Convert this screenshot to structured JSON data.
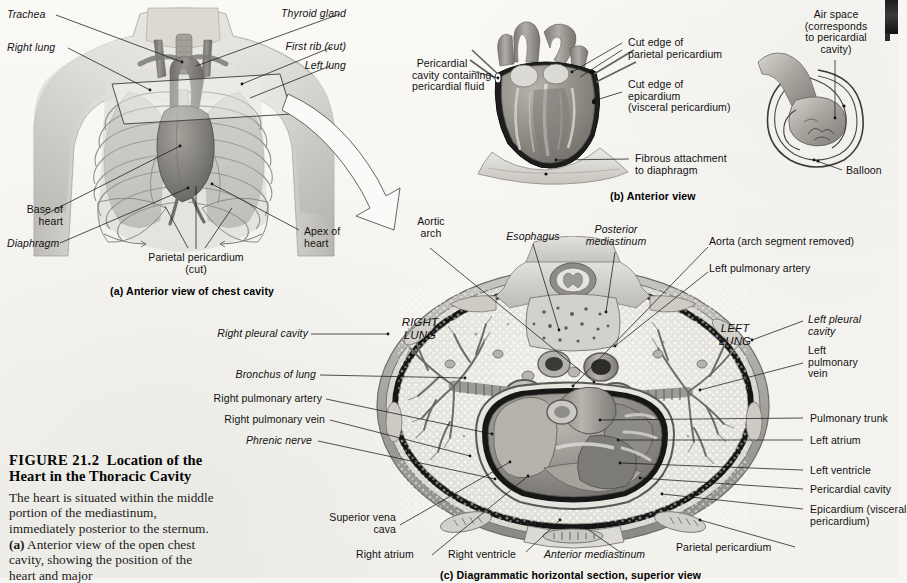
{
  "figure": {
    "number": "FIGURE 21.2",
    "title": "Location of the Heart in the Thoracic Cavity",
    "caption_parts": {
      "p1": "The heart is situated within the middle portion of the mediastinum, immediately posterior to the sternum. ",
      "a_bold": "(a)",
      "p2": " Anterior view of the open chest cavity, showing the position of the heart and major"
    }
  },
  "panel_a": {
    "caption": "(a) Anterior view of chest cavity",
    "labels": {
      "trachea": "Trachea",
      "right_lung": "Right lung",
      "thyroid_gland": "Thyroid gland",
      "first_rib": "First rib (cut)",
      "left_lung": "Left lung",
      "base_of_heart": "Base of\nheart",
      "diaphragm": "Diaphragm",
      "parietal_pericardium": "Parietal pericardium\n(cut)",
      "apex_of_heart": "Apex of\nheart"
    }
  },
  "panel_b": {
    "caption": "(b) Anterior view",
    "labels": {
      "pericardial_cavity": "Pericardial\ncavity containing\npericardial fluid",
      "cut_edge_parietal": "Cut edge of\nparietal pericardium",
      "cut_edge_epicardium": "Cut edge of\nepicardium\n(visceral pericardium)",
      "fibrous_attachment": "Fibrous attachment\nto diaphragm",
      "air_space": "Air space\n(corresponds\nto pericardial\ncavity)",
      "balloon": "Balloon"
    }
  },
  "panel_c": {
    "caption": "(c) Diagrammatic horizontal section, superior view",
    "organ_text": {
      "right_lung": "RIGHT\nLUNG",
      "left_lung": "LEFT\nLUNG"
    },
    "labels_top": {
      "aortic_arch": "Aortic\narch",
      "esophagus": "Esophagus",
      "posterior_mediastinum": "Posterior\nmediastinum",
      "aorta": "Aorta (arch segment removed)",
      "left_pulmonary_artery": "Left pulmonary artery"
    },
    "labels_left": {
      "right_pleural_cavity": "Right pleural cavity",
      "bronchus_of_lung": "Bronchus of lung",
      "right_pulmonary_artery": "Right pulmonary artery",
      "right_pulmonary_vein": "Right pulmonary vein",
      "phrenic_nerve": "Phrenic nerve",
      "superior_vena_cava": "Superior vena\ncava",
      "right_atrium": "Right atrium"
    },
    "labels_right": {
      "left_pleural_cavity": "Left pleural\ncavity",
      "left_pulmonary_vein": "Left\npulmonary\nvein",
      "pulmonary_trunk": "Pulmonary trunk",
      "left_atrium": "Left atrium",
      "left_ventricle": "Left ventricle",
      "pericardial_cavity": "Pericardial cavity",
      "epicardium": "Epicardium (visceral\npericardium)",
      "parietal_pericardium": "Parietal pericardium"
    },
    "labels_bottom": {
      "right_ventricle": "Right ventricle",
      "anterior_mediastinum": "Anterior mediastinum"
    }
  },
  "colors": {
    "page_bg": "#f7f6f3",
    "ink": "#131313",
    "tissue_mid": "#9a9a96",
    "tissue_dark": "#5d5d5a",
    "tissue_light": "#d8d7d1",
    "cavity_black": "#1a1a1a",
    "lung_fill": "#e3e2dc"
  }
}
